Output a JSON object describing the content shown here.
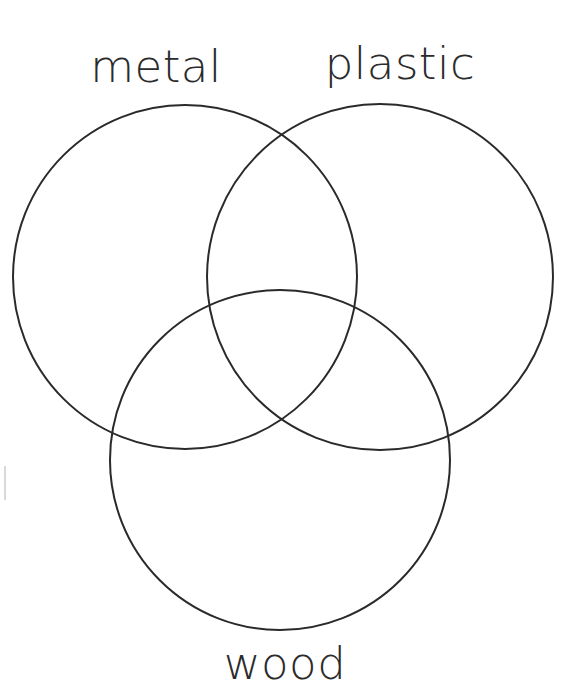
{
  "diagram": {
    "type": "venn",
    "title": "",
    "set_count": 3,
    "background_color": "#ffffff",
    "stroke_color": "#2a2a2a",
    "stroke_width": 2,
    "fill": "none",
    "sets": [
      {
        "id": "metal",
        "label": "metal",
        "label_position": "top-left",
        "label_x": 156,
        "label_y": 44,
        "circle": {
          "cx": 185,
          "cy": 277,
          "r": 172
        }
      },
      {
        "id": "plastic",
        "label": "plastic",
        "label_position": "top-right",
        "label_x": 400,
        "label_y": 41,
        "circle": {
          "cx": 380,
          "cy": 277,
          "r": 173
        }
      },
      {
        "id": "wood",
        "label": "wood",
        "label_position": "bottom-center",
        "label_x": 285,
        "label_y": 641,
        "circle": {
          "cx": 280,
          "cy": 460,
          "r": 170
        }
      }
    ],
    "regions": [
      {
        "id": "metal-only",
        "sets": [
          "metal"
        ],
        "text": ""
      },
      {
        "id": "plastic-only",
        "sets": [
          "plastic"
        ],
        "text": ""
      },
      {
        "id": "wood-only",
        "sets": [
          "wood"
        ],
        "text": ""
      },
      {
        "id": "metal-plastic",
        "sets": [
          "metal",
          "plastic"
        ],
        "text": ""
      },
      {
        "id": "metal-wood",
        "sets": [
          "metal",
          "wood"
        ],
        "text": ""
      },
      {
        "id": "plastic-wood",
        "sets": [
          "plastic",
          "wood"
        ],
        "text": ""
      },
      {
        "id": "metal-plastic-wood",
        "sets": [
          "metal",
          "plastic",
          "wood"
        ],
        "text": ""
      }
    ],
    "marks": [
      {
        "id": "left-edge-tick",
        "x": 4,
        "y": 466,
        "width": 2,
        "height": 34,
        "color": "#d9d9d9"
      }
    ]
  }
}
